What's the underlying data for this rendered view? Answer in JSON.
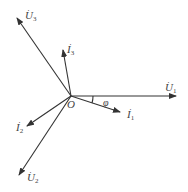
{
  "diagram": {
    "type": "phasor-diagram",
    "origin": {
      "label": "O",
      "x": 71,
      "y": 96
    },
    "angle_label": "φ",
    "vectors": [
      {
        "id": "U1",
        "symbol": "U",
        "sub": "1",
        "x2": 176,
        "y2": 96,
        "lx": 165,
        "ly": 80
      },
      {
        "id": "U2",
        "symbol": "U",
        "sub": "2",
        "x2": 19,
        "y2": 175,
        "lx": 27,
        "ly": 172
      },
      {
        "id": "U3",
        "symbol": "U",
        "sub": "3",
        "x2": 17,
        "y2": 18,
        "lx": 25,
        "ly": 8
      },
      {
        "id": "I1",
        "symbol": "I",
        "sub": "1",
        "x2": 120,
        "y2": 112,
        "lx": 127,
        "ly": 108
      },
      {
        "id": "I2",
        "symbol": "I",
        "sub": "2",
        "x2": 27,
        "y2": 126,
        "lx": 16,
        "ly": 121
      },
      {
        "id": "I3",
        "symbol": "I",
        "sub": "3",
        "x2": 63,
        "y2": 50,
        "lx": 67,
        "ly": 42
      }
    ]
  },
  "labels": {
    "origin": "O",
    "phi": "φ",
    "U1": "U",
    "U1_sub": "1",
    "U2": "U",
    "U2_sub": "2",
    "U3": "U",
    "U3_sub": "3",
    "I1": "I",
    "I1_sub": "1",
    "I2": "I",
    "I2_sub": "2",
    "I3": "I",
    "I3_sub": "3",
    "dot": "·"
  }
}
